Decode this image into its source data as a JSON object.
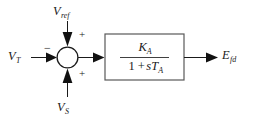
{
  "diagram": {
    "type": "control-block-diagram",
    "background_color": "#ffffff",
    "line_color": "#1a1a1a",
    "box_stroke_color": "#595959"
  },
  "inputs": {
    "terminal_voltage": {
      "symbol": "V",
      "subscript": "T",
      "sign": "−",
      "direction": "left"
    },
    "reference_voltage": {
      "symbol": "V",
      "subscript": "ref",
      "sign": "+",
      "direction": "top"
    },
    "stabilizer_voltage": {
      "symbol": "V",
      "subscript": "S",
      "sign": "+",
      "direction": "bottom"
    }
  },
  "summing_junction": {
    "name": "summing-junction",
    "shape": "circle",
    "signs": [
      "+",
      "−",
      "+"
    ]
  },
  "transfer_function": {
    "name": "amplifier-transfer-function",
    "numerator": {
      "symbol": "K",
      "subscript": "A"
    },
    "denominator": {
      "one": "1",
      "operator": "+",
      "symbol": "sT",
      "subscript": "A"
    },
    "expression": "K_A / (1 + sT_A)"
  },
  "output": {
    "field_voltage": {
      "symbol": "E",
      "subscript": "fd",
      "direction": "right"
    }
  }
}
